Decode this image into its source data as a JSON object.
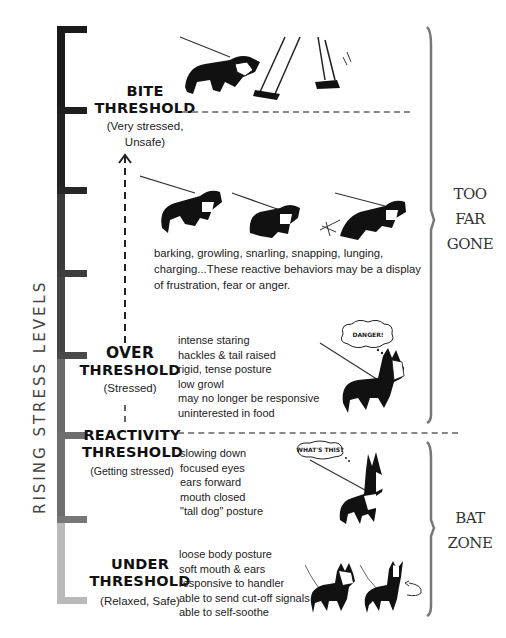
{
  "title": "",
  "side_label": "RISING STRESS LEVELS",
  "stress_bar": {
    "colors": [
      "#1a1a1a",
      "#2a2a2a",
      "#3d3d3d",
      "#4a4a4a",
      "#6a6a6a",
      "#8c8c8c",
      "#b9b9b9"
    ]
  },
  "levels": [
    {
      "id": "bite",
      "title_line1": "BITE",
      "title_line2": "THRESHOLD",
      "subtitle_line1": "(Very stressed,",
      "subtitle_line2": "Unsafe)"
    },
    {
      "id": "over",
      "title_line1": "OVER",
      "title_line2": "THRESHOLD",
      "subtitle_line1": "(Stressed)",
      "behaviors": [
        "intense staring",
        "hackles & tail raised",
        "rigid, tense posture",
        "low growl",
        "may no longer be responsive",
        "uninterested in food"
      ],
      "bubble": "DANGER!"
    },
    {
      "id": "reactivity",
      "title_line1": "REACTIVITY",
      "title_line2": "THRESHOLD",
      "subtitle_line1": "(Getting stressed)",
      "behaviors": [
        "slowing down",
        "focused eyes",
        "ears forward",
        "mouth closed",
        "\"tall dog\" posture"
      ],
      "bubble": "WHAT'S THIS?"
    },
    {
      "id": "under",
      "title_line1": "UNDER",
      "title_line2": "THRESHOLD",
      "subtitle_line1": "(Relaxed, Safe)",
      "behaviors": [
        "loose body posture",
        "soft mouth & ears",
        "responsive to handler",
        "able to send cut-off signals",
        "able to self-soothe"
      ]
    }
  ],
  "reactive_description": [
    "barking, growling, snarling, snapping, lunging,",
    "charging...These reactive behaviors may be a display",
    "of frustration, fear or anger."
  ],
  "zones": [
    {
      "line1": "TOO",
      "line2": "FAR",
      "line3": "GONE"
    },
    {
      "line1": "BAT",
      "line2": "ZONE"
    }
  ]
}
